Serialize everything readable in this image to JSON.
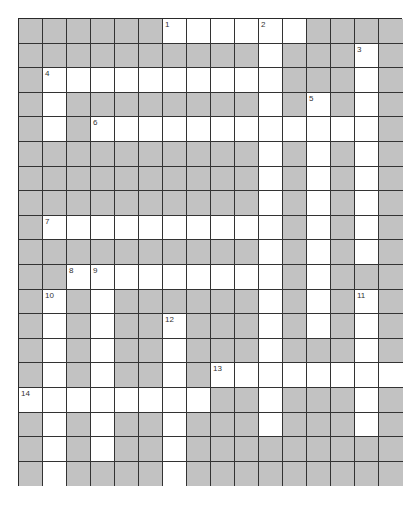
{
  "puzzle": {
    "rows": 19,
    "cols": 16,
    "colors": {
      "block": "#c2c2c2",
      "open": "#ffffff",
      "line": "#333333"
    },
    "open_cells": [
      [
        6,
        7,
        8,
        9,
        10,
        11
      ],
      [
        10,
        14
      ],
      [
        1,
        2,
        3,
        4,
        5,
        6,
        7,
        8,
        9,
        10,
        14
      ],
      [
        1,
        10,
        12,
        14
      ],
      [
        1,
        3,
        4,
        5,
        6,
        7,
        8,
        9,
        10,
        11,
        12,
        13,
        14
      ],
      [
        10,
        12,
        14
      ],
      [
        10,
        12,
        14
      ],
      [
        10,
        12,
        14
      ],
      [
        1,
        2,
        3,
        4,
        5,
        6,
        7,
        8,
        9,
        10,
        12,
        14
      ],
      [
        10,
        12,
        14
      ],
      [
        2,
        3,
        4,
        5,
        6,
        7,
        8,
        9,
        10,
        12
      ],
      [
        1,
        3,
        10,
        12,
        14
      ],
      [
        1,
        3,
        6,
        10,
        12,
        14
      ],
      [
        1,
        3,
        6,
        10,
        14
      ],
      [
        1,
        3,
        6,
        8,
        9,
        10,
        11,
        12,
        13,
        14,
        15
      ],
      [
        0,
        1,
        2,
        3,
        4,
        5,
        6,
        7,
        10,
        14
      ],
      [
        1,
        3,
        6,
        10,
        14
      ],
      [
        1,
        3,
        6
      ],
      [
        1,
        6
      ]
    ],
    "clue_numbers": [
      {
        "label": "1",
        "row": 0,
        "col": 6
      },
      {
        "label": "2",
        "row": 0,
        "col": 10
      },
      {
        "label": "3",
        "row": 1,
        "col": 14
      },
      {
        "label": "4",
        "row": 2,
        "col": 1
      },
      {
        "label": "5",
        "row": 3,
        "col": 12
      },
      {
        "label": "6",
        "row": 4,
        "col": 3
      },
      {
        "label": "7",
        "row": 8,
        "col": 1
      },
      {
        "label": "8",
        "row": 10,
        "col": 2
      },
      {
        "label": "9",
        "row": 10,
        "col": 3
      },
      {
        "label": "10",
        "row": 11,
        "col": 1
      },
      {
        "label": "11",
        "row": 11,
        "col": 14
      },
      {
        "label": "12",
        "row": 12,
        "col": 6
      },
      {
        "label": "13",
        "row": 14,
        "col": 8
      },
      {
        "label": "14",
        "row": 15,
        "col": 0
      }
    ]
  }
}
